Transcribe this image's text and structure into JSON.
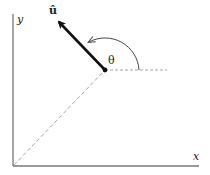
{
  "diagram": {
    "axes": {
      "x_label": "x",
      "y_label": "y"
    },
    "vector": {
      "label": "û",
      "description": "unit vector"
    },
    "angle": {
      "label": "θ"
    },
    "colors": {
      "axis": "#777777",
      "vector": "#111111",
      "dashed": "#999999",
      "arc": "#444444"
    }
  }
}
